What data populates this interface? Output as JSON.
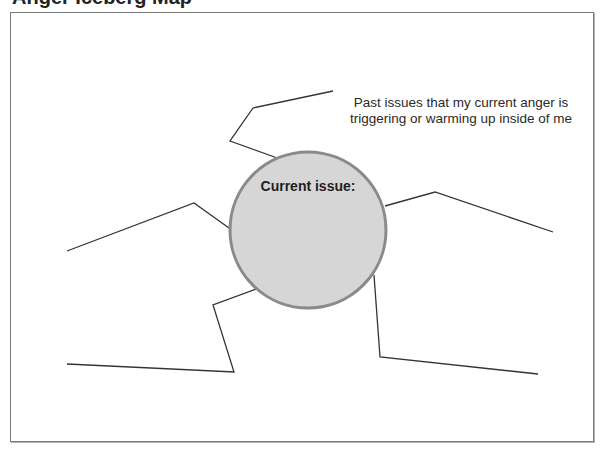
{
  "page": {
    "clipped_title": "Anger Iceberg Map"
  },
  "diagram": {
    "center_node": {
      "label": "Current issue:",
      "fill": "#d6d6d6",
      "stroke": "#8a8a8a"
    },
    "callout": {
      "line1": "Past issues that my current anger is",
      "line2": "triggering or warming up inside of me"
    },
    "branches": [
      {
        "name": "branch-top",
        "points": "333,91 253,108 230,141 280,159"
      },
      {
        "name": "branch-left",
        "points": "67,251 194,203 229,228"
      },
      {
        "name": "branch-bottom-left",
        "points": "67,364 234,372 213,305 256,289"
      },
      {
        "name": "branch-right",
        "points": "385,206 435,192 553,232"
      },
      {
        "name": "branch-bottom-right",
        "points": "374,275 380,357 538,374"
      }
    ],
    "line_color": "#333333",
    "frame_color": "#7a7a7a"
  }
}
